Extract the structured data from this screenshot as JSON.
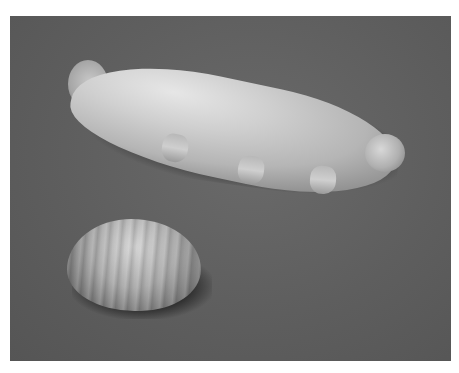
{
  "image": {
    "description": "Grayscale scanning electron micrograph of a hydrated tardigrade (water bear) crawling on a surface, with a desiccated tun-state tardigrade in the lower left",
    "subjects": [
      {
        "name": "active-tardigrade",
        "state": "hydrated",
        "legs_visible": 3
      },
      {
        "name": "tun-tardigrade",
        "state": "desiccated"
      }
    ],
    "colors": {
      "background": "#ffffff",
      "substrate": "#5e5e5e",
      "specimen_highlight": "#e6e6e6",
      "shadow": "#000000"
    }
  }
}
